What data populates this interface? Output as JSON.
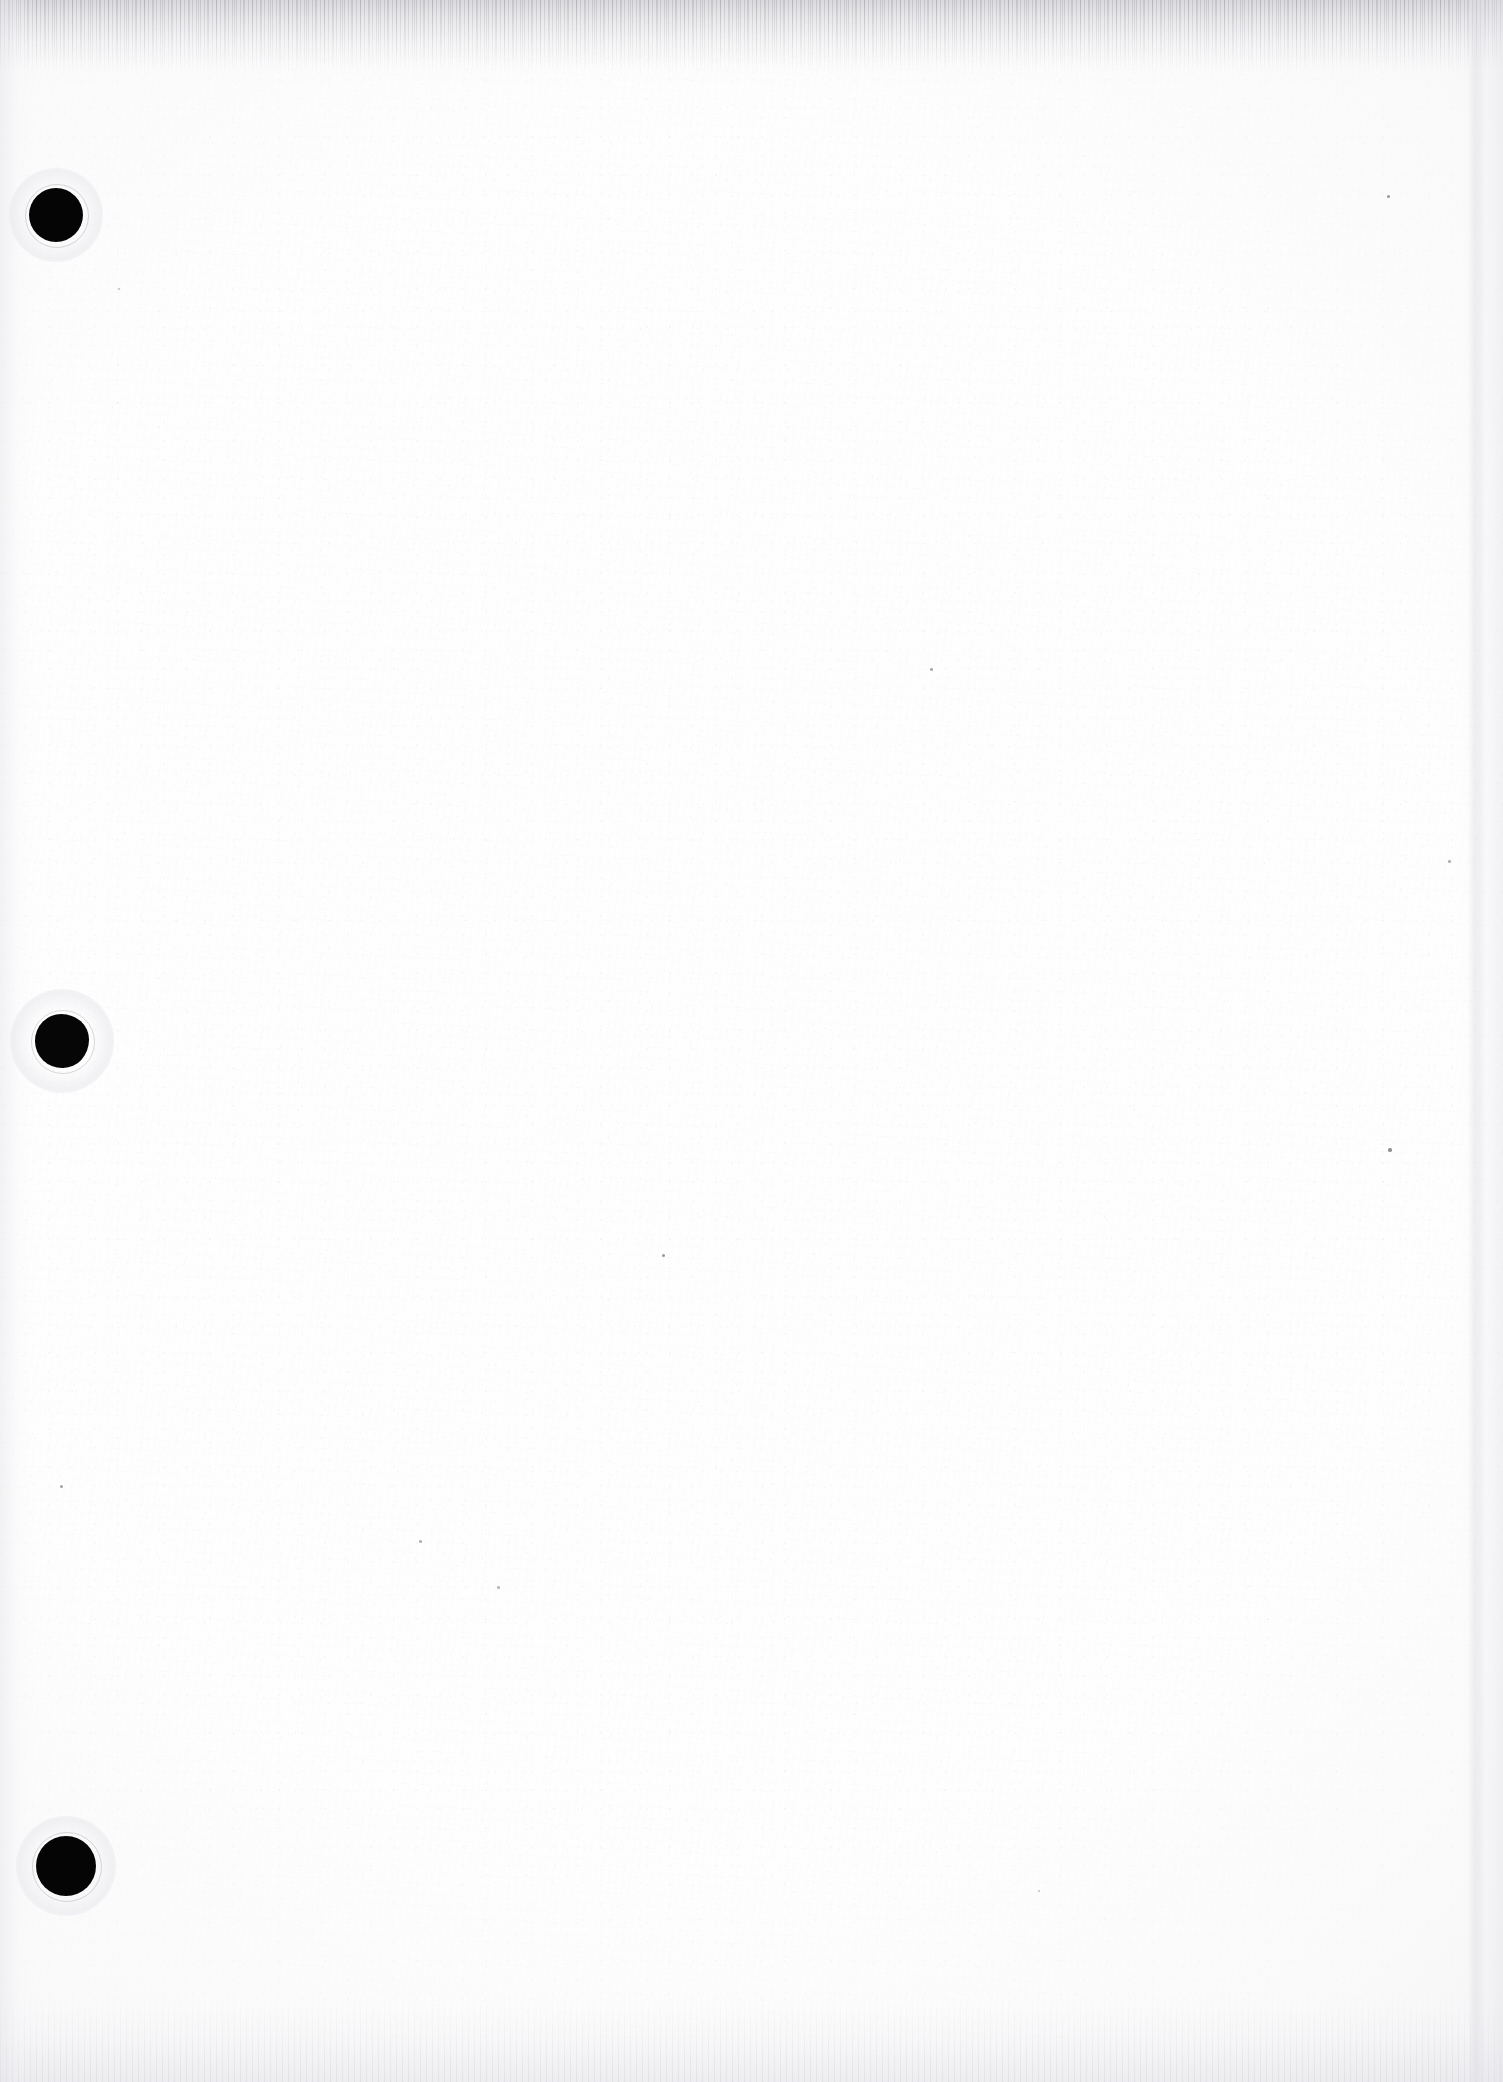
{
  "document": {
    "kind": "scanned-page",
    "content_state": "blank",
    "visible_text": "",
    "page_width": 1503,
    "page_height": 2082,
    "background_color": "#fefefe",
    "ink_color": "#050505"
  },
  "artifacts": {
    "hole_punches": [
      {
        "name": "hole-punch-top",
        "label": "",
        "cx": 56,
        "cy": 215,
        "r": 27,
        "halo_r": 47,
        "shape": "round",
        "color": "#050505"
      },
      {
        "name": "hole-punch-middle",
        "label": "",
        "cx": 62,
        "cy": 1041,
        "r": 27,
        "halo_r": 52,
        "shape": "torn",
        "color": "#060606"
      },
      {
        "name": "hole-punch-bottom",
        "label": "",
        "cx": 66,
        "cy": 1866,
        "r": 30,
        "halo_r": 50,
        "shape": "round",
        "color": "#050505"
      }
    ],
    "edges": {
      "top_band_height": 86,
      "bottom_band_height": 100,
      "left_band_width": 34,
      "right_band_width": 46,
      "streak_x": 1468,
      "edge_tone": "#d8d8dd"
    },
    "specks": [
      {
        "name": "speck-upper-right",
        "x": 1387,
        "y": 195,
        "size": 3,
        "opacity": 0.55
      },
      {
        "name": "speck-mid-left",
        "x": 60,
        "y": 1485,
        "size": 3,
        "opacity": 0.5
      },
      {
        "name": "speck-mid-right",
        "x": 1388,
        "y": 1148,
        "size": 3.5,
        "opacity": 0.6
      },
      {
        "name": "speck-center",
        "x": 662,
        "y": 1254,
        "size": 3,
        "opacity": 0.55
      },
      {
        "name": "speck-center-high",
        "x": 930,
        "y": 668,
        "size": 2.5,
        "opacity": 0.45
      },
      {
        "name": "speck-lower-left",
        "x": 419,
        "y": 1540,
        "size": 2.5,
        "opacity": 0.4
      },
      {
        "name": "speck-lower-center",
        "x": 497,
        "y": 1586,
        "size": 2.5,
        "opacity": 0.38
      },
      {
        "name": "speck-upper-left",
        "x": 118,
        "y": 288,
        "size": 2,
        "opacity": 0.35
      },
      {
        "name": "speck-far-right",
        "x": 1448,
        "y": 860,
        "size": 2.5,
        "opacity": 0.42
      },
      {
        "name": "speck-low-right",
        "x": 1038,
        "y": 1890,
        "size": 2,
        "opacity": 0.33
      }
    ]
  }
}
